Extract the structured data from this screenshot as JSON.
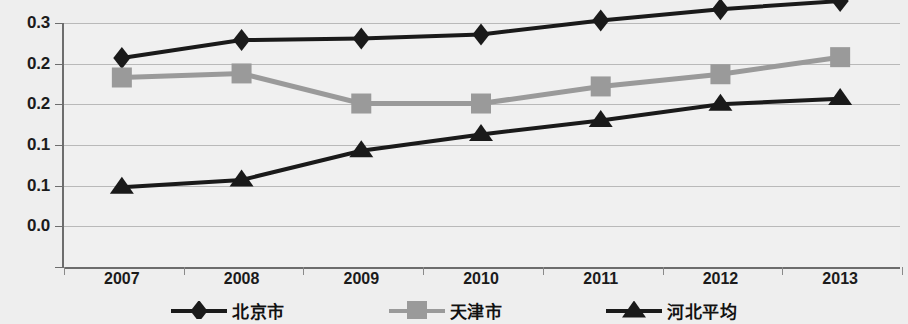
{
  "chart_data": {
    "type": "line",
    "title": "",
    "subtitle": "",
    "xlabel": "",
    "ylabel": "",
    "categories": [
      "2007",
      "2008",
      "2009",
      "2010",
      "2011",
      "2012",
      "2013"
    ],
    "x_tick_labels": [
      "2007",
      "2008",
      "2009",
      "2010",
      "2011",
      "2012",
      "2013"
    ],
    "y_tick_labels": [
      "0.3",
      "0.2",
      "0.2",
      "0.1",
      "0.1",
      "0.0"
    ],
    "y_tick_values": [
      0.3,
      0.25,
      0.2,
      0.15,
      0.1,
      0.05,
      0.0
    ],
    "ylim": [
      0.0,
      0.3
    ],
    "grid": true,
    "legend_position": "bottom",
    "series": [
      {
        "name": "北京市",
        "marker": "diamond",
        "color": "#1a1a1a",
        "values": [
          0.257,
          0.279,
          0.281,
          0.286,
          0.303,
          0.317,
          0.327
        ]
      },
      {
        "name": "天津市",
        "marker": "square",
        "color": "#9a9a9a",
        "values": [
          0.233,
          0.238,
          0.201,
          0.201,
          0.222,
          0.237,
          0.258
        ]
      },
      {
        "name": "河北平均",
        "marker": "triangle",
        "color": "#1a1a1a",
        "values": [
          0.098,
          0.107,
          0.143,
          0.163,
          0.18,
          0.2,
          0.207
        ]
      }
    ]
  },
  "legend": {
    "items": [
      {
        "label": "北京市"
      },
      {
        "label": "天津市"
      },
      {
        "label": "河北平均"
      }
    ]
  },
  "colors": {
    "series_dark": "#1a1a1a",
    "series_gray": "#9a9a9a",
    "grid": "#b9b9b9",
    "axis": "#6d6d6d",
    "background": "#eeeeee"
  }
}
